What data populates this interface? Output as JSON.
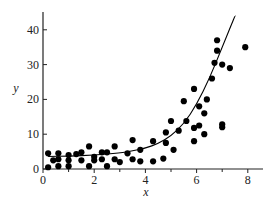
{
  "chart_data": {
    "type": "scatter",
    "title": "",
    "xlabel": "x",
    "ylabel": "y",
    "xlim": [
      0,
      8.5
    ],
    "ylim": [
      0,
      46
    ],
    "xticks": [
      0,
      2,
      4,
      6,
      8
    ],
    "xminor_ticks": [
      1,
      3,
      5,
      7
    ],
    "yticks": [
      0,
      10,
      20,
      30,
      40
    ],
    "grid": false,
    "legend": null,
    "series": [
      {
        "name": "observations",
        "type": "scatter",
        "marker": "filled-circle",
        "color": "#000000",
        "points": [
          [
            0.2,
            0.5
          ],
          [
            0.2,
            4.5
          ],
          [
            0.4,
            2.5
          ],
          [
            0.6,
            4.5
          ],
          [
            0.6,
            2.8
          ],
          [
            0.6,
            0.8
          ],
          [
            1.0,
            4.0
          ],
          [
            1.0,
            2.5
          ],
          [
            1.0,
            0.8
          ],
          [
            1.3,
            4.3
          ],
          [
            1.5,
            4.8
          ],
          [
            1.5,
            2.5
          ],
          [
            1.8,
            6.5
          ],
          [
            1.8,
            0.8
          ],
          [
            2.0,
            3.5
          ],
          [
            2.0,
            2.5
          ],
          [
            2.3,
            4.8
          ],
          [
            2.3,
            2.8
          ],
          [
            2.5,
            4.8
          ],
          [
            2.5,
            0.8
          ],
          [
            2.8,
            6.5
          ],
          [
            2.8,
            2.8
          ],
          [
            3.0,
            2.0
          ],
          [
            3.3,
            4.5
          ],
          [
            3.5,
            8.3
          ],
          [
            3.5,
            2.8
          ],
          [
            3.8,
            5.5
          ],
          [
            3.8,
            2.2
          ],
          [
            4.3,
            8.0
          ],
          [
            4.3,
            2.2
          ],
          [
            4.7,
            3.0
          ],
          [
            4.8,
            10.5
          ],
          [
            4.8,
            7.5
          ],
          [
            5.0,
            13.8
          ],
          [
            5.1,
            5.5
          ],
          [
            5.3,
            11.0
          ],
          [
            5.5,
            19.5
          ],
          [
            5.6,
            13.8
          ],
          [
            5.9,
            23.0
          ],
          [
            5.9,
            11.8
          ],
          [
            5.9,
            8.0
          ],
          [
            6.1,
            18.0
          ],
          [
            6.1,
            12.5
          ],
          [
            6.3,
            16.0
          ],
          [
            6.3,
            10.0
          ],
          [
            6.4,
            20.0
          ],
          [
            6.6,
            26.0
          ],
          [
            6.7,
            30.5
          ],
          [
            6.8,
            34.0
          ],
          [
            6.8,
            37.0
          ],
          [
            7.0,
            12.8
          ],
          [
            7.0,
            12.0
          ],
          [
            7.0,
            30.0
          ],
          [
            7.3,
            29.0
          ],
          [
            7.9,
            35.0
          ]
        ]
      },
      {
        "name": "fitted curve",
        "type": "line",
        "color": "#000000",
        "points": [
          [
            0.2,
            3.6
          ],
          [
            1.0,
            3.7
          ],
          [
            2.0,
            4.0
          ],
          [
            3.0,
            4.6
          ],
          [
            3.5,
            5.2
          ],
          [
            4.0,
            6.0
          ],
          [
            4.5,
            7.3
          ],
          [
            5.0,
            9.5
          ],
          [
            5.5,
            13.0
          ],
          [
            6.0,
            18.5
          ],
          [
            6.5,
            26.0
          ],
          [
            7.0,
            35.0
          ],
          [
            7.5,
            44.0
          ]
        ]
      }
    ]
  },
  "axes": {
    "x_label": "x",
    "y_label": "y",
    "x_tick_labels": [
      "0",
      "2",
      "4",
      "6",
      "8"
    ],
    "y_tick_labels": [
      "0",
      "10",
      "20",
      "30",
      "40"
    ]
  }
}
